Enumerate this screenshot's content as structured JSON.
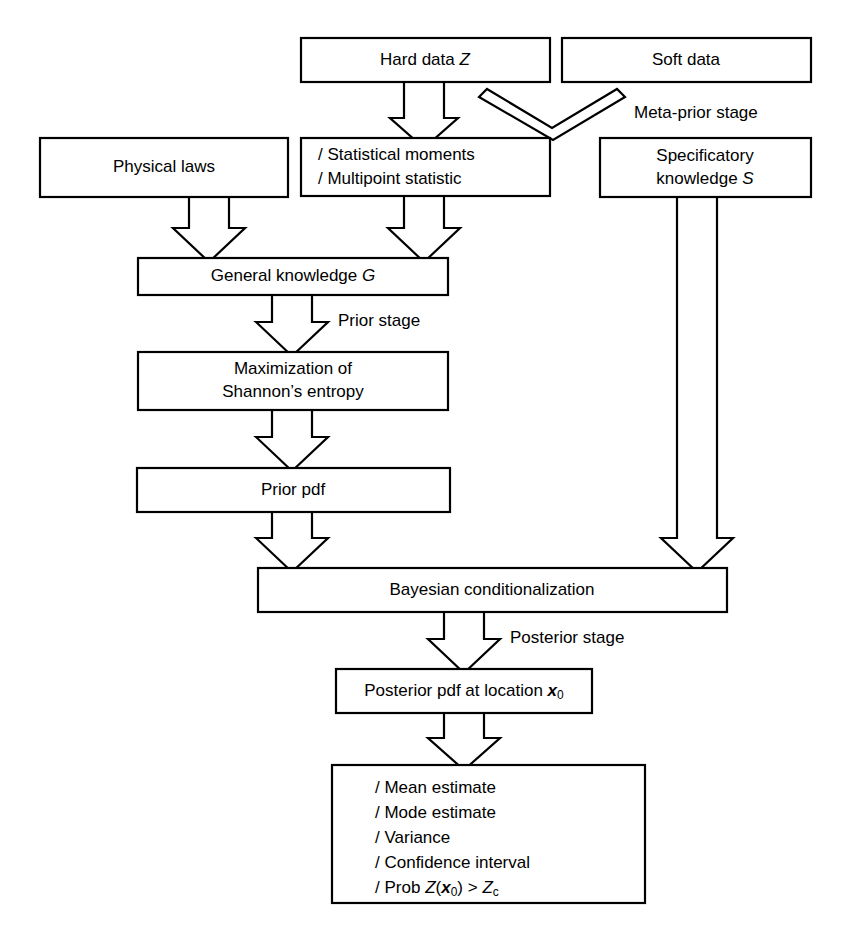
{
  "diagram": {
    "background_color": "#ffffff",
    "line_color": "#000000",
    "nodes": {
      "hard_data": {
        "label": "Hard data",
        "symbol": "Z"
      },
      "soft_data": {
        "label": "Soft data"
      },
      "physical_laws": {
        "label": "Physical laws"
      },
      "statistics": {
        "line1": "/  Statistical moments",
        "line2": "/  Multipoint statistic"
      },
      "specificatory": {
        "line1": "Specificatory",
        "line2_prefix": "knowledge",
        "line2_symbol": "S"
      },
      "general_knowledge": {
        "label": "General knowledge",
        "symbol": "G"
      },
      "maximization": {
        "line1": "Maximization of",
        "line2": "Shannon’s entropy"
      },
      "prior_pdf": {
        "label": "Prior pdf"
      },
      "bayesian": {
        "label": "Bayesian conditionalization"
      },
      "posterior_pdf": {
        "prefix": "Posterior pdf at location",
        "symbol": "x",
        "subscript": "0"
      },
      "outputs": {
        "item1": "/  Mean estimate",
        "item2": "/  Mode estimate",
        "item3": "/  Variance",
        "item4": "/  Confidence interval",
        "item5_bullet": "/",
        "item5_prob": "Prob",
        "item5_z": "Z",
        "item5_open": "(",
        "item5_x": "x",
        "item5_xsub": "0",
        "item5_close": ")",
        "item5_gt": ">",
        "item5_zc": "Z",
        "item5_zcsub": "c"
      }
    },
    "stage_labels": {
      "meta_prior": "Meta-prior stage",
      "prior": "Prior stage",
      "posterior": "Posterior stage"
    }
  }
}
